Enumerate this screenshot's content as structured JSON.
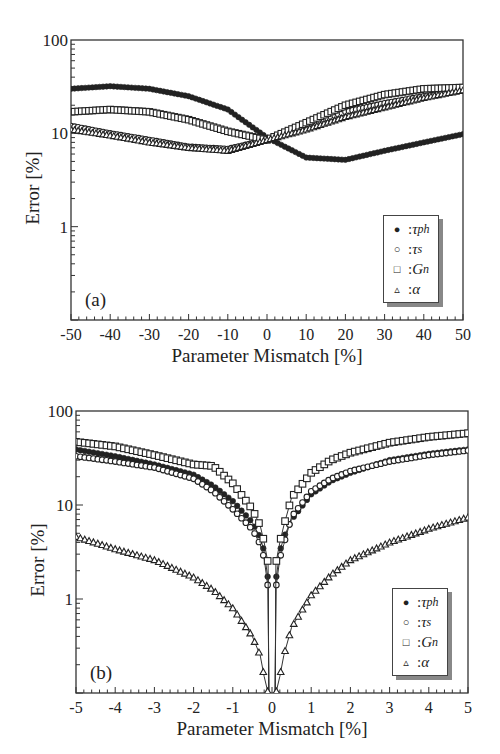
{
  "chart_data": [
    {
      "type": "scatter",
      "panel_label": "(a)",
      "title": "",
      "xlabel": "Parameter Mismatch [%]",
      "ylabel": "Error [%]",
      "yscale": "log",
      "xlim": [
        -50,
        50
      ],
      "ylim": [
        0.1,
        100
      ],
      "x_ticks": [
        "-50",
        "-40",
        "-30",
        "-20",
        "-10",
        "0",
        "10",
        "20",
        "30",
        "40",
        "50"
      ],
      "y_ticks": [
        "1",
        "10",
        "100"
      ],
      "grid": false,
      "legend_position": "lower right",
      "x": [
        -50,
        -40,
        -30,
        -20,
        -10,
        0,
        10,
        20,
        30,
        40,
        50
      ],
      "series": [
        {
          "name": "τph",
          "marker": "filled-circle",
          "values": [
            30,
            32,
            30,
            25,
            18,
            9,
            5.5,
            5.2,
            6.5,
            8,
            9.8
          ]
        },
        {
          "name": "τs",
          "marker": "open-circle",
          "values": [
            12,
            10,
            8.5,
            7.2,
            6.8,
            8.5,
            12,
            17,
            21,
            25,
            29
          ]
        },
        {
          "name": "Gn",
          "marker": "open-square",
          "values": [
            17,
            18,
            17,
            14,
            10.5,
            8.5,
            13,
            20,
            26,
            30,
            31
          ]
        },
        {
          "name": "α",
          "marker": "open-triangle",
          "values": [
            11,
            9.5,
            8,
            7,
            6.5,
            8.5,
            11,
            15,
            19,
            24,
            29
          ]
        }
      ]
    },
    {
      "type": "scatter",
      "panel_label": "(b)",
      "title": "",
      "xlabel": "Parameter Mismatch [%]",
      "ylabel": "Error [%]",
      "yscale": "log",
      "xlim": [
        -5,
        5
      ],
      "ylim": [
        0.1,
        100
      ],
      "x_ticks": [
        "-5",
        "-4",
        "-3",
        "-2",
        "-1",
        "0",
        "1",
        "2",
        "3",
        "4",
        "5"
      ],
      "y_ticks": [
        "1",
        "10",
        "100"
      ],
      "grid": false,
      "legend_position": "lower right",
      "x": [
        -5,
        -4,
        -3,
        -2,
        -1.5,
        -1,
        -0.5,
        -0.3,
        -0.2,
        -0.1,
        0.1,
        0.2,
        0.3,
        0.5,
        1,
        1.5,
        2,
        3,
        4,
        5
      ],
      "series": [
        {
          "name": "τph",
          "marker": "filled-circle",
          "values": [
            39,
            33,
            27,
            21,
            16,
            11,
            6.5,
            4.5,
            3.2,
            1.6,
            1.6,
            3.2,
            4.5,
            7,
            13,
            18,
            22,
            30,
            35,
            39
          ]
        },
        {
          "name": "τs",
          "marker": "open-circle",
          "values": [
            33,
            29,
            25,
            19,
            14,
            9,
            5.5,
            3.8,
            2.7,
            1.3,
            1.3,
            2.7,
            3.8,
            7.5,
            14,
            19,
            23,
            29,
            34,
            38
          ]
        },
        {
          "name": "Gn",
          "marker": "open-square",
          "values": [
            47,
            42,
            34,
            27,
            26,
            17,
            9,
            6,
            4,
            2.4,
            2.4,
            4,
            6,
            12,
            22,
            30,
            36,
            46,
            53,
            58
          ]
        },
        {
          "name": "α",
          "marker": "open-triangle",
          "values": [
            4.6,
            3.4,
            2.6,
            1.7,
            1.25,
            0.8,
            0.4,
            0.25,
            0.15,
            0.1,
            0.1,
            0.15,
            0.25,
            0.5,
            1.1,
            1.8,
            2.6,
            4.0,
            5.6,
            7.4
          ]
        }
      ]
    }
  ],
  "legend": [
    {
      "symbol": "●",
      "sep": " : ",
      "label": "τ",
      "sub": "ph"
    },
    {
      "symbol": "○",
      "sep": " : ",
      "label": "τ",
      "sub": "s"
    },
    {
      "symbol": "□",
      "sep": " : ",
      "label": "G",
      "sub": "n"
    },
    {
      "symbol": "▵",
      "sep": " : ",
      "label": "α",
      "sub": ""
    }
  ]
}
